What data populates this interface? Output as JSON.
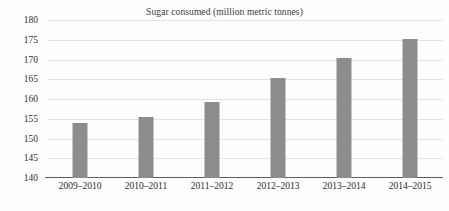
{
  "chart_data": {
    "type": "bar",
    "title": "Sugar consumed (million metric tonnes)",
    "xlabel": "",
    "ylabel": "",
    "categories": [
      "2009–2010",
      "2010–2011",
      "2011–2012",
      "2012–2013",
      "2013–2014",
      "2014–2015"
    ],
    "values": [
      154.0,
      155.5,
      159.3,
      165.3,
      170.3,
      175.3
    ],
    "ylim": [
      140,
      180
    ],
    "yticks": [
      140,
      145,
      150,
      155,
      160,
      165,
      170,
      175,
      180
    ],
    "ytick_labels": [
      "140",
      "145",
      "150",
      "155",
      "160",
      "165",
      "170",
      "175",
      "180"
    ],
    "grid": true,
    "grid_axis": "y",
    "legend": false,
    "series": [
      {
        "name": "Sugar consumed",
        "values": [
          154.0,
          155.5,
          159.3,
          165.3,
          170.3,
          175.3
        ]
      }
    ],
    "colors": {
      "bar": "#8c8c8c",
      "gridline": "#e2e2e6",
      "axis": "#5d5d5d",
      "text": "#2e2e2e",
      "background": "#fefefe"
    }
  }
}
